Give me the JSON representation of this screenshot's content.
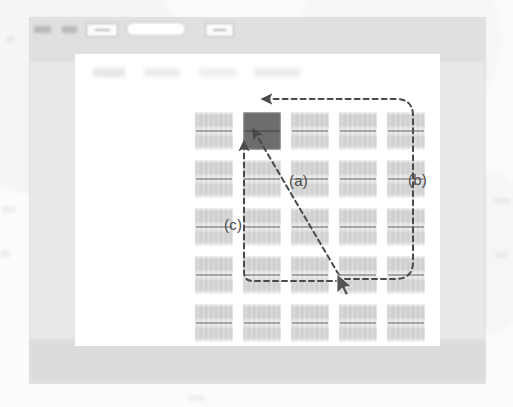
{
  "window": {
    "name": "application-window",
    "toolbar": {
      "items": [
        {
          "name": "toolbar-item-1",
          "type": "text-blob",
          "left": 4,
          "width": 17
        },
        {
          "name": "toolbar-item-2",
          "type": "text-blob",
          "left": 32,
          "width": 15
        },
        {
          "name": "toolbar-item-3",
          "type": "combo-box",
          "left": 56,
          "width": 30
        },
        {
          "name": "toolbar-item-4",
          "type": "search-pill",
          "left": 97,
          "width": 58
        },
        {
          "name": "toolbar-item-5",
          "type": "combo-box",
          "left": 175,
          "width": 27
        }
      ]
    }
  },
  "content": {
    "name": "document-content-panel",
    "header_text": "",
    "grid": {
      "name": "thumbnail-grid",
      "rows": 5,
      "columns": 5,
      "cell_count": 25,
      "selected_cell_index": 1,
      "selected_cell_row": 1,
      "selected_cell_column": 2,
      "cells": [
        {
          "id": "r1c1",
          "selected": false
        },
        {
          "id": "r1c2",
          "selected": true
        },
        {
          "id": "r1c3",
          "selected": false
        },
        {
          "id": "r1c4",
          "selected": false
        },
        {
          "id": "r1c5",
          "selected": false
        },
        {
          "id": "r2c1",
          "selected": false
        },
        {
          "id": "r2c2",
          "selected": false
        },
        {
          "id": "r2c3",
          "selected": false
        },
        {
          "id": "r2c4",
          "selected": false
        },
        {
          "id": "r2c5",
          "selected": false
        },
        {
          "id": "r3c1",
          "selected": false
        },
        {
          "id": "r3c2",
          "selected": false
        },
        {
          "id": "r3c3",
          "selected": false
        },
        {
          "id": "r3c4",
          "selected": false
        },
        {
          "id": "r3c5",
          "selected": false
        },
        {
          "id": "r4c1",
          "selected": false
        },
        {
          "id": "r4c2",
          "selected": false
        },
        {
          "id": "r4c3",
          "selected": false
        },
        {
          "id": "r4c4",
          "selected": false
        },
        {
          "id": "r4c5",
          "selected": false
        },
        {
          "id": "r5c1",
          "selected": false
        },
        {
          "id": "r5c2",
          "selected": false
        },
        {
          "id": "r5c3",
          "selected": false
        },
        {
          "id": "r5c4",
          "selected": false
        },
        {
          "id": "r5c5",
          "selected": false
        }
      ]
    }
  },
  "annotations": {
    "stroke_color": "#4a4a4a",
    "labels": [
      {
        "key": "a",
        "text": "(a)",
        "x": 289,
        "y": 172,
        "describes": "diagonal dashed arrow from cursor position up-left to selected thumbnail"
      },
      {
        "key": "b",
        "text": "(b)",
        "x": 408,
        "y": 171,
        "describes": "dashed path curving around the right side from cursor up to selected thumbnail"
      },
      {
        "key": "c",
        "text": "(c)",
        "x": 224,
        "y": 216,
        "describes": "vertical dashed arrow rising from bottom path to selected thumbnail"
      }
    ],
    "cursor": {
      "name": "mouse-cursor",
      "x": 338,
      "y": 277
    }
  }
}
